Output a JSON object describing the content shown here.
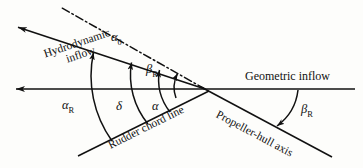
{
  "figure": {
    "type": "technical-line-diagram",
    "background_color": "#fdfdfb",
    "line_color": "#111111"
  },
  "labels": {
    "hydrodynamic_inflow_line1": "Hydrodynamic",
    "hydrodynamic_inflow_line2": "inflow",
    "geometric_inflow": "Geometric inflow",
    "rudder_chord_line": "Rudder chord line",
    "propeller_hull_axis": "Propeller-hull axis"
  },
  "angles": [
    {
      "id": "alpha0",
      "symbol": "α",
      "subscript": "0",
      "name": "zero-lift-angle-alpha-0"
    },
    {
      "id": "betaR_up",
      "symbol": "β",
      "subscript": "R",
      "name": "drift-angle-beta-R-upper"
    },
    {
      "id": "alphaR",
      "symbol": "α",
      "subscript": "R",
      "name": "rudder-inflow-angle-alpha-R"
    },
    {
      "id": "delta",
      "symbol": "δ",
      "subscript": "",
      "name": "rudder-deflection-delta"
    },
    {
      "id": "alpha",
      "symbol": "α",
      "subscript": "",
      "name": "effective-angle-of-attack-alpha"
    },
    {
      "id": "betaR_right",
      "symbol": "β",
      "subscript": "R",
      "name": "drift-angle-beta-R-right"
    }
  ],
  "geometry": {
    "origin": {
      "x": 205,
      "y": 89
    },
    "lines": [
      {
        "name": "geometric-inflow-axis",
        "from": {
          "x": 355,
          "y": 89
        },
        "to": {
          "x": 13,
          "y": 89
        },
        "style": "solid",
        "arrow": "end"
      },
      {
        "name": "hydrodynamic-inflow-axis",
        "from": {
          "x": 205,
          "y": 89
        },
        "to": {
          "x": 15,
          "y": 26
        },
        "style": "solid",
        "arrow": "end"
      },
      {
        "name": "rudder-chord-line",
        "from": {
          "x": 205,
          "y": 89
        },
        "to": {
          "x": 78,
          "y": 156
        },
        "style": "solid",
        "arrow": "none"
      },
      {
        "name": "propeller-hull-axis",
        "from": {
          "x": 205,
          "y": 89
        },
        "to": {
          "x": 330,
          "y": 156
        },
        "style": "solid",
        "arrow": "none"
      },
      {
        "name": "zero-lift-reference-line",
        "from": {
          "x": 205,
          "y": 89
        },
        "to": {
          "x": 62,
          "y": 8
        },
        "style": "dash-dot",
        "arrow": "none"
      }
    ]
  }
}
